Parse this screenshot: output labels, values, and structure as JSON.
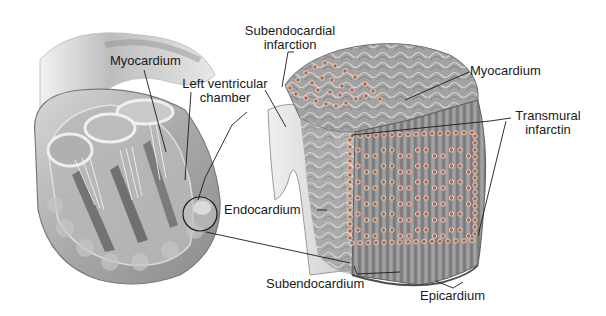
{
  "figure": {
    "background_color": "#ffffff",
    "dot_color": "#b4643c"
  },
  "labels": {
    "myocardium_left": "Myocardium",
    "left_ventricular_chamber_line1": "Left ventricular",
    "left_ventricular_chamber_line2": "chamber",
    "subendocardial_infarction_line1": "Subendocardial",
    "subendocardial_infarction_line2": "infarction",
    "myocardium_right": "Myocardium",
    "transmural_infarction_line1": "Transmural",
    "transmural_infarction_line2": "infarctin",
    "endocardium": "Endocardium",
    "subendocardium": "Subendocardium",
    "epicardium": "Epicardium"
  },
  "panels": [
    {
      "name": "heart-cross-section",
      "description": "Cut-away heart showing ventricles, papillary muscles and chordae tendineae with magnified circle on left ventricular wall"
    },
    {
      "name": "myocardial-wall-block",
      "description": "Magnified block of ventricular wall showing subendocardial and transmural infarction zones outlined with dots"
    }
  ]
}
